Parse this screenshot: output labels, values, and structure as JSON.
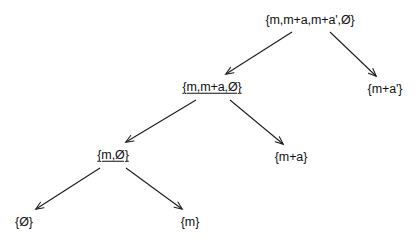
{
  "diagram": {
    "type": "set-inclusion-tree",
    "background_color": "#ffffff",
    "edge_color": "#1a1a1a",
    "text_color": "#111111",
    "nodes": [
      {
        "id": "root",
        "label": "{m,m+a,m+a',0}",
        "underlined": false,
        "x": 310,
        "y": 20
      },
      {
        "id": "left1",
        "label": "{m,m+a,0}",
        "underlined": true,
        "x": 212,
        "y": 87
      },
      {
        "id": "right1",
        "label": "{m+a'}",
        "underlined": false,
        "x": 385,
        "y": 89
      },
      {
        "id": "left2",
        "label": "{m,0}",
        "underlined": true,
        "x": 113,
        "y": 155
      },
      {
        "id": "right2",
        "label": "{m+a}",
        "underlined": false,
        "x": 291,
        "y": 157
      },
      {
        "id": "leaf-zero",
        "label": "{0}",
        "underlined": false,
        "x": 24,
        "y": 222
      },
      {
        "id": "leaf-m",
        "label": "{m}",
        "underlined": false,
        "x": 190,
        "y": 222
      }
    ],
    "edges": [
      {
        "id": "root-to-left1",
        "from": "root",
        "to": "left1",
        "x1": 292,
        "y1": 32,
        "x2": 226,
        "y2": 74
      },
      {
        "id": "root-to-right1",
        "from": "root",
        "to": "right1",
        "x1": 330,
        "y1": 32,
        "x2": 376,
        "y2": 76
      },
      {
        "id": "left1-to-left2",
        "from": "left1",
        "to": "left2",
        "x1": 196,
        "y1": 100,
        "x2": 126,
        "y2": 142
      },
      {
        "id": "left1-to-right2",
        "from": "left1",
        "to": "right2",
        "x1": 230,
        "y1": 100,
        "x2": 283,
        "y2": 144
      },
      {
        "id": "left2-to-zero",
        "from": "left2",
        "to": "leaf-zero",
        "x1": 100,
        "y1": 168,
        "x2": 36,
        "y2": 209
      },
      {
        "id": "left2-to-m",
        "from": "left2",
        "to": "leaf-m",
        "x1": 126,
        "y1": 168,
        "x2": 182,
        "y2": 209
      }
    ]
  }
}
